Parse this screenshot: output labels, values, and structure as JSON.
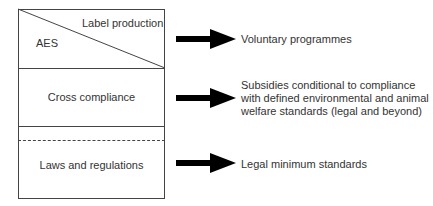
{
  "diagram": {
    "top_section": {
      "upper_right_label": "Label production",
      "lower_left_label": "AES"
    },
    "middle_section": {
      "label": "Cross compliance"
    },
    "bottom_section": {
      "label": "Laws and regulations"
    },
    "arrows": [
      {
        "target": "Voluntary programmes"
      },
      {
        "target_lines": [
          "Subsidies conditional to compliance",
          "with defined environmental and animal",
          "welfare standards (legal and beyond)"
        ]
      },
      {
        "target": "Legal minimum standards"
      }
    ],
    "colors": {
      "line": "#444444",
      "arrow": "#000000",
      "text": "#333333"
    }
  }
}
